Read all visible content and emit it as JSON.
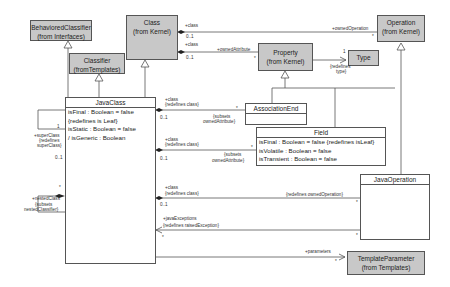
{
  "classes": {
    "behavioredClassifier": {
      "name": "BehavioredClassifier",
      "package": "(from Interfaces)"
    },
    "class": {
      "name": "Class",
      "package": "(from Kernel)"
    },
    "classifier": {
      "name": "Classifier",
      "package": "(fromTemplates)"
    },
    "property": {
      "name": "Property",
      "package": "(from Kernel)"
    },
    "type": {
      "name": "Type"
    },
    "operation": {
      "name": "Operation",
      "package": "(from Kernel)"
    },
    "templateParameter": {
      "name": "TemplateParameter",
      "package": "(from Templates)"
    },
    "javaClass": {
      "name": "JavaClass",
      "attributes": [
        "isFinal : Boolean = false",
        "{redefines is Leaf}",
        "isStatic : Boolean = false",
        "/ isGeneric : Boolean"
      ]
    },
    "associationEnd": {
      "name": "AssociationEnd"
    },
    "field": {
      "name": "Field",
      "attributes": [
        "isFinal : Boolean = false {redefines isLeaf}",
        "isVolatile : Boolean = false",
        "isTransient : Boolean = false"
      ]
    },
    "javaOperation": {
      "name": "JavaOperation"
    }
  },
  "labels": {
    "class_owned_op_role": "+class",
    "class_owned_op_mult": "0..1",
    "owned_operation": "+ownedOperation",
    "owned_operation_mult": "*",
    "class_owned_attr_role": "+class",
    "class_owned_attr_mult": "0..1",
    "owned_attribute": "+ownedAttribute",
    "owned_attribute_mult": "*",
    "type_mult": "1",
    "redefines_type": "{redefines",
    "redefines_type2": "type}",
    "super_class_mult": "1",
    "super_class": "+superClass",
    "super_class_redef1": "{redefines",
    "super_class_redef2": "superClass}",
    "nested_mult_top": "0..1",
    "nested_mult": "*",
    "nested_classifier": "+nestedClass",
    "nested_subsets1": "{subsets",
    "nested_subsets2": "nestedClassifier}",
    "ae_class": "+class",
    "ae_redef": "{redefines class}",
    "ae_mult": "0..1",
    "ae_star": "*",
    "ae_subsets1": "{subsets",
    "ae_subsets2": "ownedAttribute}",
    "field_class": "+class",
    "field_redef": "{redefines class}",
    "field_mult": "0..1",
    "field_star": "*",
    "field_subsets1": "{subsets",
    "field_subsets2": "ownedAttribute}",
    "jo_class": "+class",
    "jo_redef": "{redefines class}",
    "jo_mult": "0..1",
    "jo_owned_op": "{redefines ownedOperation}",
    "jo_star": "*",
    "jexc": "+javaExceptions",
    "jexc_redef": "{redefines raisedException}",
    "jexc_star": "*",
    "jexc_star2": "*",
    "params": "+parameters",
    "params_star": "*"
  },
  "colors": {
    "library_class_fill": "#c8c8c8",
    "line": "#555555"
  }
}
